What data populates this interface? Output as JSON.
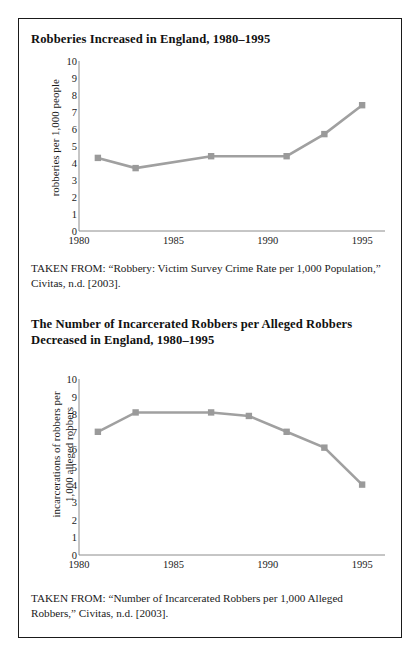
{
  "figure": {
    "panels": [
      {
        "title": "Robberies Increased in England, 1980–1995",
        "source": "TAKEN FROM: “Robbery: Victim Survey Crime Rate per 1,000 Population,” Civitas, n.d. [2003]."
      },
      {
        "title": "The Number of Incarcerated Robbers per Alleged Robbers Decreased in England, 1980–1995",
        "source": "TAKEN FROM: “Number of Incarcerated Robbers per 1,000 Alleged Robbers,” Civitas, n.d. [2003]."
      }
    ],
    "line_color": "#a0a0a0",
    "marker_color": "#9a9a9a",
    "axis_color": "#8c8c8c"
  },
  "chart_data": [
    {
      "type": "line",
      "title": "Robberies Increased in England, 1980–1995",
      "xlabel": "",
      "ylabel": "robberies per 1,000 people",
      "x": [
        1981,
        1983,
        1987,
        1991,
        1993,
        1995
      ],
      "values": [
        4.3,
        3.7,
        4.4,
        4.4,
        5.7,
        7.4
      ],
      "xlim": [
        1980,
        1996
      ],
      "ylim": [
        0,
        10
      ],
      "xticks": [
        1980,
        1985,
        1990,
        1995
      ],
      "yticks": [
        0,
        1,
        2,
        3,
        4,
        5,
        6,
        7,
        8,
        9,
        10
      ],
      "grid": false,
      "legend": "none"
    },
    {
      "type": "line",
      "title": "The Number of Incarcerated Robbers per Alleged Robbers Decreased in England, 1980–1995",
      "xlabel": "",
      "ylabel": "incarcerations of robbers per 1,000 alleged robbers",
      "ylabel_lines": [
        "incarcerations of robbers per",
        "1,000 alleged robbers"
      ],
      "x": [
        1981,
        1983,
        1987,
        1989,
        1991,
        1993,
        1995
      ],
      "values": [
        7.0,
        8.1,
        8.1,
        7.9,
        7.0,
        6.1,
        4.0
      ],
      "xlim": [
        1980,
        1996
      ],
      "ylim": [
        0,
        10
      ],
      "xticks": [
        1980,
        1985,
        1990,
        1995
      ],
      "yticks": [
        0,
        1,
        2,
        3,
        4,
        5,
        6,
        7,
        8,
        9,
        10
      ],
      "grid": false,
      "legend": "none"
    }
  ]
}
